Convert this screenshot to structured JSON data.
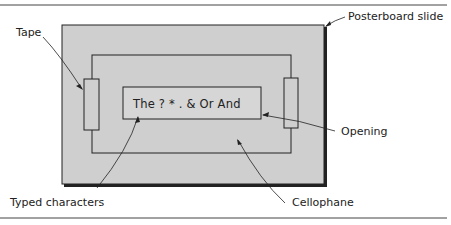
{
  "figure": {
    "labels": {
      "posterboard": "Posterboard slide",
      "tape": "Tape",
      "opening": "Opening",
      "typed_characters": "Typed characters",
      "cellophane": "Cellophane"
    },
    "typed_text": "The ? * . & Or And",
    "colors": {
      "posterboard_fill": "#cfcfcf",
      "line": "#222222",
      "rule": "#444444",
      "background": "#ffffff"
    }
  }
}
